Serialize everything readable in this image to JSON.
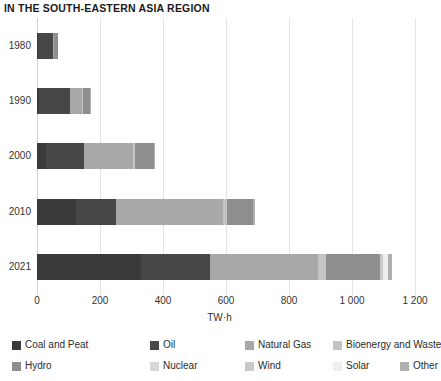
{
  "chart_data": {
    "type": "bar",
    "orientation": "horizontal",
    "stacked": true,
    "title": "IN THE SOUTH-EASTERN ASIA REGION",
    "xlabel": "TW·h",
    "ylabel": "",
    "xlim": [
      0,
      1200
    ],
    "xticks": [
      0,
      200,
      400,
      600,
      800,
      1000,
      1200
    ],
    "xticklabels": [
      "0",
      "200",
      "400",
      "600",
      "800",
      "1 000",
      "1 200"
    ],
    "categories": [
      "1980",
      "1990",
      "2000",
      "2010",
      "2021"
    ],
    "grid": "vertical",
    "legend_position": "bottom",
    "series": [
      {
        "name": "Coal and Peat",
        "color": "#3a3a3a",
        "values": [
          3,
          7,
          28,
          125,
          330
        ]
      },
      {
        "name": "Oil",
        "color": "#474747",
        "values": [
          48,
          98,
          120,
          125,
          218
        ]
      },
      {
        "name": "Natural Gas",
        "color": "#a8a8a8",
        "values": [
          2,
          38,
          158,
          340,
          345
        ]
      },
      {
        "name": "Bioenergy and Waste",
        "color": "#c4c4c4",
        "values": [
          0,
          2,
          6,
          14,
          24
        ]
      },
      {
        "name": "Hydro",
        "color": "#8e8e8e",
        "values": [
          13,
          22,
          58,
          83,
          172
        ]
      },
      {
        "name": "Nuclear",
        "color": "#d8d8d8",
        "values": [
          0,
          0,
          0,
          0,
          0
        ]
      },
      {
        "name": "Wind",
        "color": "#c9c9c9",
        "values": [
          0,
          0,
          0,
          0,
          8
        ]
      },
      {
        "name": "Solar",
        "color": "#efefef",
        "values": [
          0,
          0,
          0,
          0,
          16
        ]
      },
      {
        "name": "Other",
        "color": "#b0b0b0",
        "values": [
          0,
          1,
          2,
          5,
          14
        ]
      }
    ],
    "totals": [
      66,
      168,
      372,
      692,
      1127
    ]
  },
  "legend": {
    "items": [
      {
        "label": "Coal and Peat",
        "color": "#3a3a3a"
      },
      {
        "label": "Oil",
        "color": "#474747"
      },
      {
        "label": "Natural Gas",
        "color": "#a8a8a8"
      },
      {
        "label": "Bioenergy and Waste",
        "color": "#c4c4c4"
      },
      {
        "label": "Hydro",
        "color": "#8e8e8e"
      },
      {
        "label": "Nuclear",
        "color": "#d8d8d8"
      },
      {
        "label": "Wind",
        "color": "#c9c9c9"
      },
      {
        "label": "Solar",
        "color": "#efefef"
      },
      {
        "label": "Other",
        "color": "#b0b0b0"
      }
    ]
  }
}
